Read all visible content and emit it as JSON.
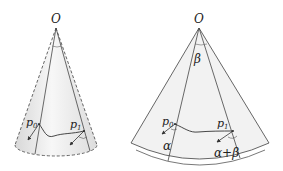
{
  "figure": {
    "left_cone": {
      "apex_label": "O",
      "point0_label": "p",
      "point0_sub": "0",
      "point1_label": "p",
      "point1_sub": "1"
    },
    "right_sector": {
      "apex_label": "O",
      "sector_angle_label": "β",
      "point0_label": "p",
      "point0_sub": "0",
      "point1_label": "p",
      "point1_sub": "1",
      "angle0_label": "α",
      "angle1_label": "α+β"
    },
    "colors": {
      "fill": "#f0f0f0",
      "stroke": "#444444",
      "text": "#222222"
    }
  }
}
